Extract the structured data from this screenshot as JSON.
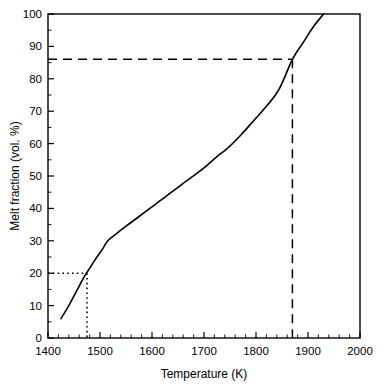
{
  "chart_data": {
    "type": "line",
    "title": "",
    "xlabel": "Temperature (K)",
    "ylabel": "Melt fraction (vol. %)",
    "xlim": [
      1400,
      2000
    ],
    "ylim": [
      0,
      100
    ],
    "xticks": [
      1400,
      1500,
      1600,
      1700,
      1800,
      1900,
      2000
    ],
    "xtick_labels": [
      "1400",
      "1500",
      "1600",
      "1700",
      "1800",
      "1900",
      "2000"
    ],
    "x_minor_tick_interval": 20,
    "yticks": [
      0,
      10,
      20,
      30,
      40,
      50,
      60,
      70,
      80,
      90,
      100
    ],
    "ytick_labels": [
      "0",
      "10",
      "20",
      "30",
      "40",
      "50",
      "60",
      "70",
      "80",
      "90",
      "100"
    ],
    "y_minor_tick_interval": 5,
    "grid": false,
    "legend": null,
    "legend_position": "none",
    "series": [
      {
        "name": "Melt fraction curve",
        "line_style": "solid",
        "color": "#000000",
        "x": [
          1425,
          1440,
          1455,
          1470,
          1480,
          1492,
          1505,
          1515,
          1530,
          1550,
          1575,
          1600,
          1625,
          1650,
          1675,
          1700,
          1725,
          1745,
          1770,
          1795,
          1820,
          1845,
          1870,
          1890,
          1910,
          1930
        ],
        "y": [
          6,
          10,
          14.5,
          19,
          21.5,
          24.5,
          27.5,
          30,
          32,
          34.5,
          37.5,
          40.5,
          43.5,
          46.5,
          49.5,
          52.5,
          56,
          58.5,
          62.5,
          67,
          71.5,
          77,
          86,
          91,
          96,
          100
        ]
      }
    ],
    "annotations": [
      {
        "name": "lower-guide",
        "line_style": "dotted",
        "x_value": 1475,
        "y_value": 20,
        "description": "Dotted construction lines from y-axis at 20 vol. % to curve, then down to x-axis near 1475 K"
      },
      {
        "name": "upper-guide",
        "line_style": "dashed",
        "x_value": 1870,
        "y_value": 86,
        "description": "Dashed construction lines from y-axis at 86 vol. % to curve, then down to x-axis near 1870 K"
      }
    ]
  },
  "axes": {
    "x_title": "Temperature (K)",
    "y_title": "Melt fraction (vol. %)"
  },
  "colors": {
    "background": "#ffffff",
    "foreground": "#000000",
    "curve": "#000000"
  }
}
